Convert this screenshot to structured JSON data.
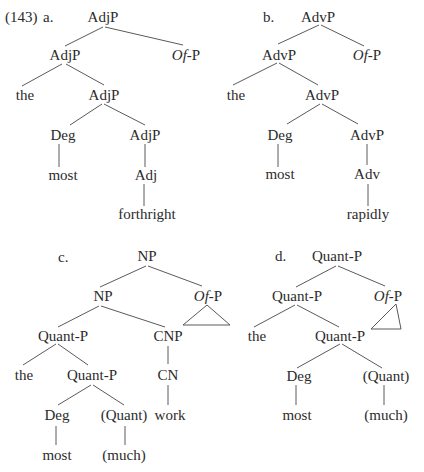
{
  "example_number": "(143)",
  "trees": [
    {
      "letter": "a.",
      "nodes": {
        "root": "AdjP",
        "l1_left": "AdjP",
        "l1_right_italic": "Of",
        "l1_right_rest": "-P",
        "the": "the",
        "l2_right": "AdjP",
        "deg": "Deg",
        "l3_right": "AdjP",
        "most": "most",
        "head": "Adj",
        "word": "forthright"
      }
    },
    {
      "letter": "b.",
      "nodes": {
        "root": "AdvP",
        "l1_left": "AdvP",
        "l1_right_italic": "Of",
        "l1_right_rest": "-P",
        "the": "the",
        "l2_right": "AdvP",
        "deg": "Deg",
        "l3_right": "AdvP",
        "most": "most",
        "head": "Adv",
        "word": "rapidly"
      }
    },
    {
      "letter": "c.",
      "nodes": {
        "root": "NP",
        "l1_left": "NP",
        "l1_right_italic": "Of",
        "l1_right_rest": "-P",
        "quantp": "Quant-P",
        "cnp": "CNP",
        "the": "the",
        "quantp2": "Quant-P",
        "cn": "CN",
        "deg": "Deg",
        "quant": "(Quant)",
        "work": "work",
        "most": "most",
        "much": "(much)"
      }
    },
    {
      "letter": "d.",
      "nodes": {
        "root": "Quant-P",
        "l1_left": "Quant-P",
        "l1_right_italic": "Of",
        "l1_right_rest": "-P",
        "the": "the",
        "quantp2": "Quant-P",
        "deg": "Deg",
        "quant": "(Quant)",
        "most": "most",
        "much": "(much)"
      }
    }
  ]
}
